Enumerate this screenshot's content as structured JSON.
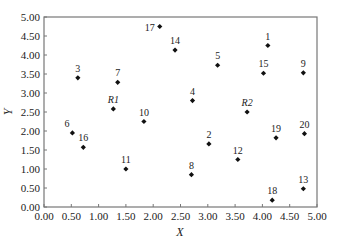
{
  "chart_data": {
    "type": "scatter",
    "title": "",
    "xlabel": "X",
    "ylabel": "Y",
    "xlim": [
      0,
      5
    ],
    "ylim": [
      0,
      5
    ],
    "grid": false,
    "legend": null,
    "x_ticks": [
      "0.00",
      "0.50",
      "1.00",
      "1.50",
      "2.00",
      "2.50",
      "3.00",
      "3.50",
      "4.00",
      "4.50",
      "5.00"
    ],
    "y_ticks": [
      "0.00",
      "0.50",
      "1.00",
      "1.50",
      "2.00",
      "2.50",
      "3.00",
      "3.50",
      "4.00",
      "4.50",
      "5.00"
    ],
    "marker": "diamond",
    "marker_color": "#111111",
    "points": [
      {
        "label": "1",
        "x": 4.1,
        "y": 4.25,
        "italic": false,
        "label_pos": "top"
      },
      {
        "label": "2",
        "x": 3.02,
        "y": 1.66,
        "italic": false,
        "label_pos": "top"
      },
      {
        "label": "3",
        "x": 0.62,
        "y": 3.4,
        "italic": false,
        "label_pos": "top"
      },
      {
        "label": "4",
        "x": 2.72,
        "y": 2.8,
        "italic": false,
        "label_pos": "top"
      },
      {
        "label": "5",
        "x": 3.18,
        "y": 3.73,
        "italic": false,
        "label_pos": "top"
      },
      {
        "label": "6",
        "x": 0.52,
        "y": 1.95,
        "italic": false,
        "label_pos": "top-left"
      },
      {
        "label": "7",
        "x": 1.35,
        "y": 3.28,
        "italic": false,
        "label_pos": "top"
      },
      {
        "label": "8",
        "x": 2.7,
        "y": 0.85,
        "italic": false,
        "label_pos": "top"
      },
      {
        "label": "9",
        "x": 4.75,
        "y": 3.53,
        "italic": false,
        "label_pos": "top"
      },
      {
        "label": "10",
        "x": 1.83,
        "y": 2.25,
        "italic": false,
        "label_pos": "top"
      },
      {
        "label": "11",
        "x": 1.5,
        "y": 1.0,
        "italic": false,
        "label_pos": "top"
      },
      {
        "label": "12",
        "x": 3.55,
        "y": 1.25,
        "italic": false,
        "label_pos": "top"
      },
      {
        "label": "13",
        "x": 4.75,
        "y": 0.48,
        "italic": false,
        "label_pos": "top"
      },
      {
        "label": "14",
        "x": 2.4,
        "y": 4.13,
        "italic": false,
        "label_pos": "top"
      },
      {
        "label": "15",
        "x": 4.02,
        "y": 3.52,
        "italic": false,
        "label_pos": "top"
      },
      {
        "label": "16",
        "x": 0.72,
        "y": 1.57,
        "italic": false,
        "label_pos": "top"
      },
      {
        "label": "17",
        "x": 2.12,
        "y": 4.75,
        "italic": false,
        "label_pos": "left"
      },
      {
        "label": "18",
        "x": 4.18,
        "y": 0.18,
        "italic": false,
        "label_pos": "top"
      },
      {
        "label": "19",
        "x": 4.25,
        "y": 1.82,
        "italic": false,
        "label_pos": "top"
      },
      {
        "label": "20",
        "x": 4.77,
        "y": 1.93,
        "italic": false,
        "label_pos": "top"
      },
      {
        "label": "R1",
        "x": 1.27,
        "y": 2.58,
        "italic": true,
        "label_pos": "top"
      },
      {
        "label": "R2",
        "x": 3.72,
        "y": 2.5,
        "italic": true,
        "label_pos": "top"
      }
    ]
  },
  "layout": {
    "plot_left": 44,
    "plot_right": 317,
    "plot_top": 17,
    "plot_bottom": 207,
    "axis_color": "#777777",
    "tick_font_size": 11,
    "label_font_size": 10
  }
}
